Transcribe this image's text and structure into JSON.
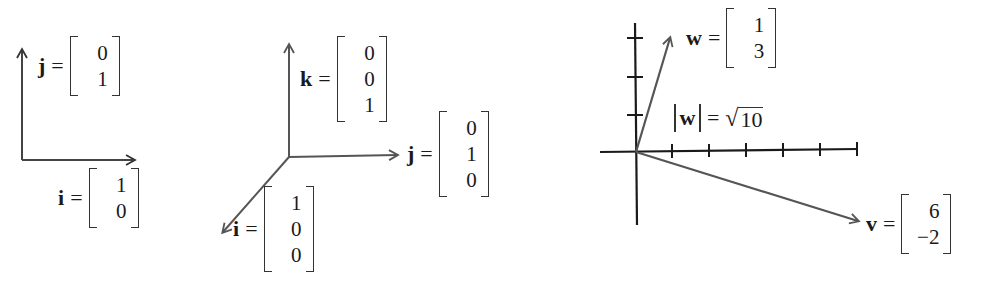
{
  "colors": {
    "axis": "#1a1a1a",
    "vector": "#555555",
    "text": "#1a1a1a",
    "background": "#ffffff"
  },
  "panels": [
    {
      "id": "standard-basis-2d",
      "vectors": [
        {
          "name": "j",
          "equals": "=",
          "components": [
            "0",
            "1"
          ]
        },
        {
          "name": "i",
          "equals": "=",
          "components": [
            "1",
            "0"
          ]
        }
      ]
    },
    {
      "id": "standard-basis-3d",
      "vectors": [
        {
          "name": "k",
          "equals": "=",
          "components": [
            "0",
            "0",
            "1"
          ]
        },
        {
          "name": "j",
          "equals": "=",
          "components": [
            "0",
            "1",
            "0"
          ]
        },
        {
          "name": "i",
          "equals": "=",
          "components": [
            "1",
            "0",
            "0"
          ]
        }
      ]
    },
    {
      "id": "vector-plot",
      "vectors": [
        {
          "name": "w",
          "equals": "=",
          "components": [
            "1",
            "3"
          ]
        },
        {
          "name": "v",
          "equals": "=",
          "components": [
            "6",
            "−2"
          ]
        }
      ],
      "norm": {
        "bar_left": "|",
        "var": "w",
        "bar_right": "|",
        "equals": "=",
        "sqrt_symbol": "√",
        "radicand": "10"
      },
      "axes": {
        "x_ticks": [
          1,
          2,
          3,
          4,
          5,
          6
        ],
        "y_ticks": [
          1,
          2,
          3
        ]
      }
    }
  ]
}
